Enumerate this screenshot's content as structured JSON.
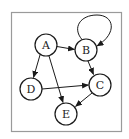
{
  "diagram": {
    "type": "directed-graph",
    "frame": {
      "x": 11,
      "y": 12,
      "width": 111,
      "height": 120,
      "stroke": "#9a9a9a"
    },
    "style": {
      "node_stroke": "#1a1a1a",
      "node_fill": "#ffffff",
      "edge_stroke": "#1a1a1a",
      "node_radius": 11
    },
    "nodes": [
      {
        "id": "A",
        "label": "A",
        "cx": 46,
        "cy": 45
      },
      {
        "id": "B",
        "label": "B",
        "cx": 86,
        "cy": 50
      },
      {
        "id": "C",
        "label": "C",
        "cx": 100,
        "cy": 85
      },
      {
        "id": "D",
        "label": "D",
        "cx": 31,
        "cy": 89
      },
      {
        "id": "E",
        "label": "E",
        "cx": 66,
        "cy": 114
      }
    ],
    "edges": [
      {
        "from": "A",
        "to": "B"
      },
      {
        "from": "A",
        "to": "D"
      },
      {
        "from": "A",
        "to": "E"
      },
      {
        "from": "B",
        "to": "B",
        "self_loop": true
      },
      {
        "from": "B",
        "to": "C"
      },
      {
        "from": "D",
        "to": "C"
      },
      {
        "from": "C",
        "to": "E"
      }
    ]
  }
}
